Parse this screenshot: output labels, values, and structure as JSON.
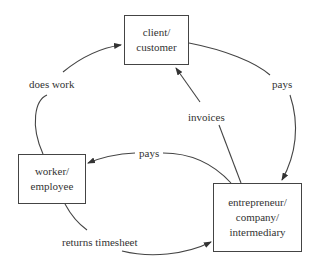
{
  "nodes": {
    "client": {
      "lines": [
        "client/",
        "customer"
      ]
    },
    "worker": {
      "lines": [
        "worker/",
        "employee"
      ]
    },
    "entrepreneur": {
      "lines": [
        "entrepreneur/",
        "company/",
        "intermediary"
      ]
    }
  },
  "edges": {
    "does_work": {
      "label": "does work",
      "from": "worker",
      "to": "client"
    },
    "pays_client": {
      "label": "pays",
      "from": "client",
      "to": "entrepreneur"
    },
    "invoices": {
      "label": "invoices",
      "from": "entrepreneur",
      "to": "client"
    },
    "pays_worker": {
      "label": "pays",
      "from": "entrepreneur",
      "to": "worker"
    },
    "returns_timesheet": {
      "label": "returns timesheet",
      "from": "worker",
      "to": "entrepreneur"
    }
  },
  "colors": {
    "stroke": "#444444",
    "text": "#333333",
    "background": "#ffffff"
  }
}
